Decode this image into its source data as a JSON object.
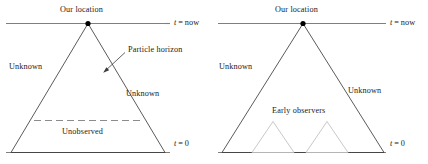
{
  "figure": {
    "kind": "cosmology-light-cone-diagram",
    "panels": [
      {
        "id": "left",
        "labels": {
          "apex": "Our location",
          "t_now": "t = now",
          "t_zero": "t = 0",
          "unknown_left": "Unknown",
          "unknown_right": "Unknown",
          "particle_horizon": "Particle horizon",
          "unobserved": "Unobserved"
        }
      },
      {
        "id": "right",
        "labels": {
          "apex": "Our location",
          "t_now": "t = now",
          "t_zero": "t = 0",
          "unknown_left": "Unknown",
          "unknown_right": "Unknown",
          "early_observers": "Early observers"
        }
      }
    ]
  },
  "chart_data": {
    "type": "diagram",
    "title": "",
    "subtitle": "",
    "xlabel": "",
    "ylabel": "",
    "colors": {
      "line": "#3c3c3c",
      "axis": "#7a7a7a",
      "dashed": "#8c8c8c",
      "small_triangle": "#bfbfbf",
      "point": "#000000",
      "text": "#1a1a1a",
      "background": "#ffffff"
    },
    "panels": [
      {
        "name": "left",
        "t_now_line": {
          "x1": 6,
          "x2": 170,
          "y": 23
        },
        "t_zero_line": {
          "x1": 6,
          "x2": 170,
          "y": 152
        },
        "cone": {
          "apex": [
            88,
            23
          ],
          "base_left": [
            11,
            152
          ],
          "base_right": [
            165,
            152
          ]
        },
        "dashed_line": {
          "x1": 34,
          "x2": 143,
          "y": 120
        },
        "point": {
          "x": 88,
          "y": 23
        },
        "annotation_arrow": {
          "from": [
            124,
            53
          ],
          "to": [
            104,
            72
          ]
        },
        "text_positions": {
          "apex": [
            62,
            7
          ],
          "t_now": [
            174,
            18
          ],
          "t_zero": [
            174,
            140
          ],
          "unknown_left": [
            10,
            63
          ],
          "unknown_right": [
            126,
            90
          ],
          "particle_horizon": [
            127,
            48
          ],
          "unobserved": [
            62,
            128
          ]
        }
      },
      {
        "name": "right",
        "t_now_line": {
          "x1": 218,
          "x2": 386,
          "y": 23
        },
        "t_zero_line": {
          "x1": 218,
          "x2": 386,
          "y": 152
        },
        "cone": {
          "apex": [
            303,
            23
          ],
          "base_left": [
            222,
            152
          ],
          "base_right": [
            384,
            152
          ]
        },
        "point": {
          "x": 303,
          "y": 23
        },
        "small_triangles": [
          {
            "apex": [
              273,
              122
            ],
            "base_left": [
              253,
              152
            ],
            "base_right": [
              293,
              152
            ]
          },
          {
            "apex": [
              327,
              122
            ],
            "base_left": [
              307,
              152
            ],
            "base_right": [
              347,
              152
            ]
          }
        ],
        "text_positions": {
          "apex": [
            277,
            7
          ],
          "t_now": [
            390,
            18
          ],
          "t_zero": [
            390,
            140
          ],
          "unknown_left": [
            220,
            63
          ],
          "unknown_right": [
            348,
            87
          ],
          "early_observers": [
            272,
            108
          ]
        }
      }
    ]
  }
}
